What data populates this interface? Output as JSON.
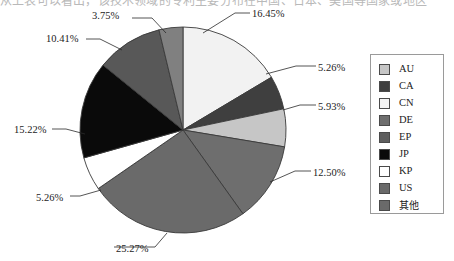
{
  "title_strip": {
    "text": "从上表可以看出，该技术领域的专利主要分布在中国、日本、美国等国家或地区"
  },
  "chart_data": {
    "type": "pie",
    "title": "",
    "legend_position": "right",
    "categories": [
      "CN",
      "CA",
      "AU",
      "US",
      "其他",
      "KP",
      "JP",
      "DE",
      "EP"
    ],
    "values": [
      16.45,
      5.26,
      5.93,
      12.5,
      25.27,
      5.26,
      15.22,
      10.41,
      3.75
    ],
    "labels": [
      "16.45%",
      "5.26%",
      "5.93%",
      "12.50%",
      "25.27%",
      "5.26%",
      "15.22%",
      "10.41%",
      "3.75%"
    ],
    "colors": [
      "#f2f2f2",
      "#3f3f3f",
      "#c6c6c6",
      "#6e6e6e",
      "#6a6a6a",
      "#ffffff",
      "#0a0a0a",
      "#585858",
      "#808080"
    ],
    "slice_order_clockwise_from_top": [
      "CN",
      "CA",
      "AU",
      "US",
      "其他",
      "KP",
      "JP",
      "DE",
      "EP"
    ],
    "start_angle_deg": 0,
    "stroke_color": "#3a3a3a",
    "center": {
      "x": 183,
      "y": 130
    },
    "radius": 103
  },
  "pie": {
    "slices": [
      {
        "name": "CN",
        "pct": 16.45,
        "label": "16.45%",
        "color": "#f2f2f2",
        "label_x": 252,
        "label_y": 8,
        "leader": [
          [
            203,
            33
          ],
          [
            235,
            13
          ],
          [
            250,
            13
          ]
        ]
      },
      {
        "name": "CA",
        "pct": 5.26,
        "label": "5.26%",
        "color": "#3f3f3f",
        "label_x": 318,
        "label_y": 62,
        "leader": [
          [
            266,
            74
          ],
          [
            296,
            66
          ],
          [
            316,
            66
          ]
        ]
      },
      {
        "name": "AU",
        "pct": 5.93,
        "label": "5.93%",
        "color": "#c6c6c6",
        "label_x": 318,
        "label_y": 101,
        "leader": [
          [
            283,
            110
          ],
          [
            300,
            105
          ],
          [
            316,
            105
          ]
        ]
      },
      {
        "name": "US",
        "pct": 12.5,
        "label": "12.50%",
        "color": "#6e6e6e",
        "label_x": 313,
        "label_y": 167,
        "leader": [
          [
            270,
            182
          ],
          [
            295,
            171
          ],
          [
            311,
            171
          ]
        ]
      },
      {
        "name": "其他",
        "pct": 25.27,
        "label": "25.27%",
        "color": "#6a6a6a",
        "label_x": 116,
        "label_y": 243,
        "leader": [
          [
            167,
            233
          ],
          [
            155,
            247
          ],
          [
            114,
            247
          ]
        ]
      },
      {
        "name": "KP",
        "pct": 5.26,
        "label": "5.26%",
        "color": "#ffffff",
        "label_x": 36,
        "label_y": 192,
        "leader": [
          [
            101,
            190
          ],
          [
            80,
            196
          ],
          [
            70,
            196
          ]
        ]
      },
      {
        "name": "JP",
        "pct": 15.22,
        "label": "15.22%",
        "color": "#0a0a0a",
        "label_x": 14,
        "label_y": 124,
        "leader": [
          [
            85,
            134
          ],
          [
            66,
            129
          ],
          [
            52,
            129
          ]
        ]
      },
      {
        "name": "DE",
        "pct": 10.41,
        "label": "10.41%",
        "color": "#585858",
        "label_x": 46,
        "label_y": 33,
        "leader": [
          [
            122,
            50
          ],
          [
            100,
            39
          ],
          [
            86,
            39
          ]
        ]
      },
      {
        "name": "EP",
        "pct": 3.75,
        "label": "3.75%",
        "color": "#808080",
        "label_x": 92,
        "label_y": 10,
        "leader": [
          [
            166,
            33
          ],
          [
            152,
            18
          ],
          [
            132,
            18
          ]
        ]
      }
    ]
  },
  "legend": {
    "items": [
      {
        "label": "AU",
        "color": "#c6c6c6",
        "cjk": false
      },
      {
        "label": "CA",
        "color": "#3f3f3f",
        "cjk": false
      },
      {
        "label": "CN",
        "color": "#f2f2f2",
        "cjk": false
      },
      {
        "label": "DE",
        "color": "#6e6e6e",
        "cjk": false
      },
      {
        "label": "EP",
        "color": "#5e5e5e",
        "cjk": false
      },
      {
        "label": "JP",
        "color": "#0a0a0a",
        "cjk": false
      },
      {
        "label": "KP",
        "color": "#ffffff",
        "cjk": false
      },
      {
        "label": "US",
        "color": "#6a6a6a",
        "cjk": false
      },
      {
        "label": "其他",
        "color": "#6a6a6a",
        "cjk": true
      }
    ]
  }
}
